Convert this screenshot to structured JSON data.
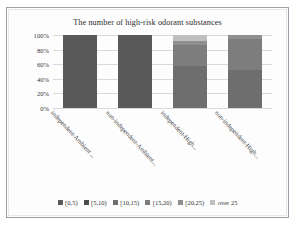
{
  "chart_data": {
    "type": "bar",
    "subtype": "100% stacked bar",
    "title": "The number of high-risk odorant substances",
    "xlabel": "",
    "ylabel": "",
    "ylim": [
      0,
      100
    ],
    "ytick_labels": [
      "0%",
      "20%",
      "40%",
      "60%",
      "80%",
      "100%"
    ],
    "ytick_values": [
      0,
      20,
      40,
      60,
      80,
      100
    ],
    "grid": true,
    "legend_position": "bottom",
    "categories": [
      "independent-Ambient ...",
      "non-independent-Ambient...",
      "independent-High...",
      "non-independent-High..."
    ],
    "series": [
      {
        "name": "[0,5)",
        "color": "#595959",
        "values": [
          100,
          100,
          0,
          0
        ]
      },
      {
        "name": "[5,10)",
        "color": "#4c4c4c",
        "values": [
          0,
          0,
          0,
          0
        ]
      },
      {
        "name": "[10,15)",
        "color": "#6e6e6e",
        "values": [
          0,
          0,
          57,
          52
        ]
      },
      {
        "name": "[15,20)",
        "color": "#7d7d7d",
        "values": [
          0,
          0,
          30,
          43
        ]
      },
      {
        "name": "[20,25)",
        "color": "#8f8f8f",
        "values": [
          0,
          0,
          5,
          5
        ]
      },
      {
        "name": "over 25",
        "color": "#bfbfbf",
        "values": [
          0,
          0,
          8,
          0
        ]
      }
    ]
  },
  "legend": {
    "items": [
      {
        "label": "[0,5)",
        "color": "#595959"
      },
      {
        "label": "[5,10)",
        "color": "#4c4c4c"
      },
      {
        "label": "[10,15)",
        "color": "#6e6e6e"
      },
      {
        "label": "[15,20)",
        "color": "#7d7d7d"
      },
      {
        "label": "[20,25)",
        "color": "#8f8f8f"
      },
      {
        "label": "over 25",
        "color": "#bfbfbf"
      }
    ]
  }
}
